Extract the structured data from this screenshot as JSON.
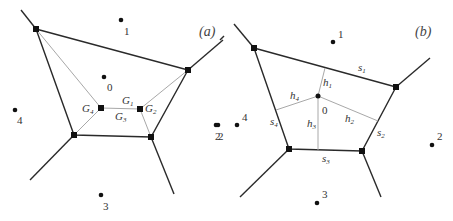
{
  "panels": {
    "a": {
      "label": "(a)",
      "sites": [
        {
          "id": "0",
          "label": "0",
          "x": 104,
          "y": 77
        },
        {
          "id": "1",
          "label": "1",
          "x": 121,
          "y": 20
        },
        {
          "id": "2",
          "label": "2",
          "x": 216,
          "y": 125
        },
        {
          "id": "3",
          "label": "3",
          "x": 101,
          "y": 195
        },
        {
          "id": "4",
          "label": "4",
          "x": 15,
          "y": 110
        }
      ],
      "centroids": [
        {
          "name": "G1",
          "base": "G",
          "sub": "1"
        },
        {
          "name": "G2",
          "base": "G",
          "sub": "2"
        },
        {
          "name": "G3",
          "base": "G",
          "sub": "3"
        },
        {
          "name": "G4",
          "base": "G",
          "sub": "4"
        }
      ]
    },
    "b": {
      "label": "(b)",
      "sites": [
        {
          "id": "0",
          "label": "0"
        },
        {
          "id": "1",
          "label": "1"
        },
        {
          "id": "2",
          "label": "2"
        },
        {
          "id": "2b",
          "label": "2"
        },
        {
          "id": "3",
          "label": "3"
        },
        {
          "id": "4",
          "label": "4"
        }
      ],
      "heights": [
        {
          "name": "h1",
          "base": "h",
          "sub": "1"
        },
        {
          "name": "h2",
          "base": "h",
          "sub": "2"
        },
        {
          "name": "h3",
          "base": "h",
          "sub": "3"
        },
        {
          "name": "h4",
          "base": "h",
          "sub": "4"
        }
      ],
      "sides": [
        {
          "name": "s1",
          "base": "s",
          "sub": "1"
        },
        {
          "name": "s2",
          "base": "s",
          "sub": "2"
        },
        {
          "name": "s3",
          "base": "s",
          "sub": "3"
        },
        {
          "name": "s4",
          "base": "s",
          "sub": "4"
        }
      ]
    }
  },
  "colors": {
    "edge": "#2a2a2a",
    "construction": "#a8a8a8",
    "point": "#111111"
  }
}
